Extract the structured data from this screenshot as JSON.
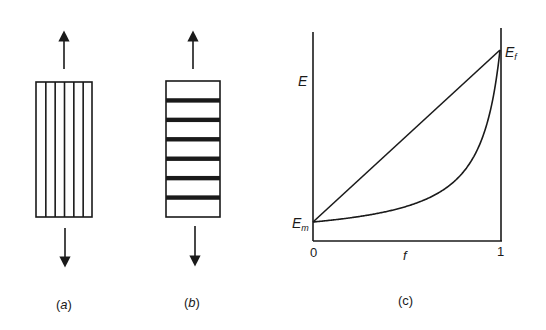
{
  "panels": {
    "a": {
      "caption": "(a)",
      "caption_letter": "a",
      "description": "fibres parallel to loading direction",
      "fibre_orientation": "longitudinal",
      "fibre_count": 5,
      "arrows": [
        "up",
        "down"
      ]
    },
    "b": {
      "caption": "(b)",
      "caption_letter": "b",
      "description": "fibres perpendicular to loading direction",
      "fibre_orientation": "transverse",
      "fibre_count": 6,
      "arrows": [
        "up",
        "down"
      ]
    },
    "c": {
      "caption": "(c)",
      "y_axis_label": "E",
      "x_axis_label": "f",
      "x_tick_start": "0",
      "x_tick_end": "1",
      "label_low": {
        "main": "E",
        "sub": "m"
      },
      "label_high": {
        "main": "E",
        "sub": "f"
      }
    }
  },
  "chart_data": {
    "type": "line",
    "title": "",
    "xlabel": "f",
    "ylabel": "E",
    "xlim": [
      0,
      1
    ],
    "x_ticks": [
      "0",
      "1"
    ],
    "grid": false,
    "legend": null,
    "annotations": [
      "E_m at f=0",
      "E_f at f=1"
    ],
    "series": [
      {
        "name": "upper bound (parallel, linear rule of mixtures)",
        "x": [
          0,
          1
        ],
        "values": [
          0.1,
          1.0
        ]
      },
      {
        "name": "lower bound (series, inverse rule of mixtures)",
        "x": [
          0,
          0.2,
          0.4,
          0.6,
          0.8,
          0.9,
          0.95,
          1.0
        ],
        "values": [
          0.1,
          0.12,
          0.16,
          0.22,
          0.36,
          0.53,
          0.68,
          1.0
        ]
      }
    ],
    "Em_relative": 0.1,
    "Ef_relative": 1.0
  },
  "colors": {
    "ink": "#1a1a1a",
    "background": "#ffffff"
  }
}
